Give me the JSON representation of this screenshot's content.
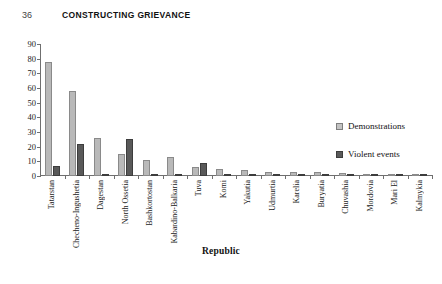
{
  "runhead": {
    "folio": "36",
    "title": "CONSTRUCTING GRIEVANCE"
  },
  "legend": {
    "position": "right",
    "items": [
      {
        "label": "Demonstrations",
        "color": "#c3c3c3"
      },
      {
        "label": "Violent events",
        "color": "#5a5a5a"
      }
    ]
  },
  "chart_data": {
    "type": "bar",
    "title": "",
    "xlabel": "Republic",
    "ylabel": "",
    "ylim": [
      0,
      90
    ],
    "yticks": [
      0,
      10,
      20,
      30,
      40,
      50,
      60,
      70,
      80,
      90
    ],
    "grid": false,
    "categories": [
      "Tatarstan",
      "Checheno-Ingushetia",
      "Dagestan",
      "North Ossetia",
      "Bashkortostan",
      "Kabardino-Balkaria",
      "Tuva",
      "Komi",
      "Yakutia",
      "Udmurtia",
      "Karelia",
      "Buryatia",
      "Chuvashia",
      "Mordovia",
      "Mari El",
      "Kalmykia"
    ],
    "series": [
      {
        "name": "Demonstrations",
        "color": "#b9b9b9",
        "values": [
          78,
          58,
          26,
          15,
          11,
          13,
          6,
          5,
          4,
          3,
          3,
          3,
          2,
          1,
          1,
          1
        ]
      },
      {
        "name": "Violent events",
        "color": "#595959",
        "values": [
          7,
          22,
          1,
          25,
          0,
          0,
          9,
          0,
          1,
          0,
          0,
          0,
          0,
          0,
          0,
          0
        ]
      }
    ]
  }
}
